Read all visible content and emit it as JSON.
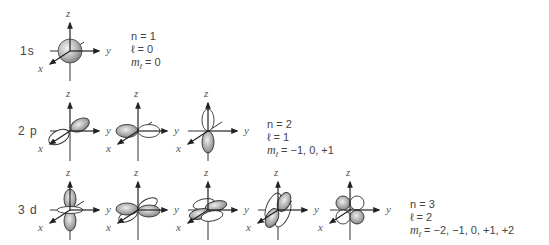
{
  "axes": {
    "x": "x",
    "y": "y",
    "z": "z"
  },
  "rows": [
    {
      "label": "1s",
      "orbital_count": 1,
      "orbitals": [
        "s"
      ],
      "n": "n = 1",
      "l": "ℓ = 0",
      "ml_prefix": "m",
      "ml_sub": "ℓ",
      "ml_value": " = 0"
    },
    {
      "label": "2 p",
      "orbital_count": 3,
      "orbitals": [
        "p_x",
        "p_y",
        "p_z"
      ],
      "n": "n = 2",
      "l": "ℓ = 1",
      "ml_prefix": "m",
      "ml_sub": "ℓ",
      "ml_value": " = −1, 0, +1"
    },
    {
      "label": "3 d",
      "orbital_count": 5,
      "orbitals": [
        "d_z2",
        "d_xy-like",
        "d_xy",
        "d_xz",
        "d_yz"
      ],
      "n": "n = 3",
      "l": "ℓ = 2",
      "ml_prefix": "m",
      "ml_sub": "ℓ",
      "ml_value": " = −2, −1, 0, +1, +2"
    }
  ],
  "colors": {
    "lobe_fill_dark": "#8a8a8a",
    "lobe_fill_light": "#e6e6e6",
    "lobe_outline": "#333333",
    "axis": "#333333",
    "text": "#444444"
  }
}
